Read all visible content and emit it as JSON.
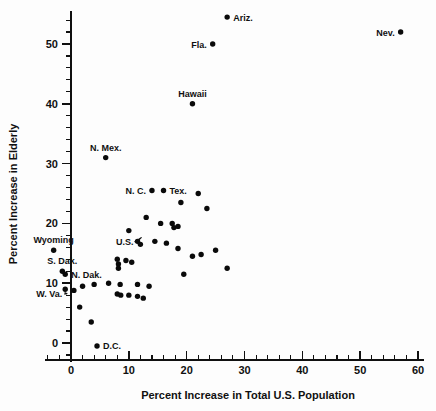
{
  "chart_data": {
    "type": "scatter",
    "title": "",
    "xlabel": "Percent Increase in Total U.S. Population",
    "ylabel": "Percent Increase in Elderly",
    "xlim": [
      -5,
      61
    ],
    "ylim": [
      -4,
      56
    ],
    "x_ticks": [
      0,
      10,
      20,
      30,
      40,
      50,
      60
    ],
    "x_tick_labels": [
      "0",
      "10",
      "20",
      "30",
      "40",
      "50",
      "60"
    ],
    "x_minor_step": 2,
    "y_ticks": [
      0,
      10,
      20,
      30,
      40,
      50
    ],
    "y_tick_labels": [
      "0",
      "10",
      "20",
      "30",
      "40",
      "50"
    ],
    "y_minor_step": 2,
    "grid": false,
    "legend": false,
    "marker": "filled-circle",
    "marker_color": "#0a0a0a",
    "points": [
      {
        "label": "Ariz.",
        "x": 27.0,
        "y": 54.5,
        "label_pos": "right"
      },
      {
        "label": "Nev.",
        "x": 57.0,
        "y": 52.0,
        "label_pos": "left"
      },
      {
        "label": "Fla.",
        "x": 24.5,
        "y": 50.0,
        "label_pos": "left"
      },
      {
        "label": "Hawaii",
        "x": 21.0,
        "y": 40.0,
        "label_pos": "above"
      },
      {
        "label": "N. Mex.",
        "x": 6.0,
        "y": 31.0,
        "label_pos": "above"
      },
      {
        "label": "N. C.",
        "x": 14.0,
        "y": 25.5,
        "label_pos": "left"
      },
      {
        "label": "Tex.",
        "x": 16.0,
        "y": 25.5,
        "label_pos": "right"
      },
      {
        "label": "Wyoming",
        "x": -3.0,
        "y": 15.5,
        "label_pos": "above"
      },
      {
        "label": "S. Dak.",
        "x": -1.5,
        "y": 12.0,
        "label_pos": "above"
      },
      {
        "label": "N. Dak.",
        "x": -1.0,
        "y": 11.5,
        "label_pos": "right"
      },
      {
        "label": "W. Va.",
        "x": -1.0,
        "y": 9.0,
        "label_pos": "leader"
      },
      {
        "label": "D.C.",
        "x": 4.5,
        "y": -0.5,
        "label_pos": "right"
      },
      {
        "label": "U.S.",
        "x": 11.5,
        "y": 17.0,
        "label_pos": "leader-right"
      },
      {
        "label": "",
        "x": 19.0,
        "y": 23.5
      },
      {
        "label": "",
        "x": 22.0,
        "y": 25.0
      },
      {
        "label": "",
        "x": 23.5,
        "y": 22.5
      },
      {
        "label": "",
        "x": 13.0,
        "y": 21.0
      },
      {
        "label": "",
        "x": 15.5,
        "y": 20.0
      },
      {
        "label": "",
        "x": 17.5,
        "y": 20.0
      },
      {
        "label": "",
        "x": 17.8,
        "y": 19.3
      },
      {
        "label": "",
        "x": 18.5,
        "y": 19.5
      },
      {
        "label": "",
        "x": 10.0,
        "y": 18.8
      },
      {
        "label": "",
        "x": 14.5,
        "y": 17.0
      },
      {
        "label": "",
        "x": 16.5,
        "y": 16.7
      },
      {
        "label": "",
        "x": 12.0,
        "y": 16.5
      },
      {
        "label": "",
        "x": 18.5,
        "y": 15.8
      },
      {
        "label": "",
        "x": 21.0,
        "y": 14.5
      },
      {
        "label": "",
        "x": 22.5,
        "y": 14.8
      },
      {
        "label": "",
        "x": 25.0,
        "y": 15.5
      },
      {
        "label": "",
        "x": 8.0,
        "y": 14.0
      },
      {
        "label": "",
        "x": 9.5,
        "y": 13.8
      },
      {
        "label": "",
        "x": 10.5,
        "y": 13.5
      },
      {
        "label": "",
        "x": 8.2,
        "y": 13.2
      },
      {
        "label": "",
        "x": 8.2,
        "y": 12.5
      },
      {
        "label": "",
        "x": 19.5,
        "y": 11.5
      },
      {
        "label": "",
        "x": 27.0,
        "y": 12.5
      },
      {
        "label": "",
        "x": 2.0,
        "y": 9.5
      },
      {
        "label": "",
        "x": 4.0,
        "y": 9.8
      },
      {
        "label": "",
        "x": 6.5,
        "y": 10.0
      },
      {
        "label": "",
        "x": 8.5,
        "y": 9.8
      },
      {
        "label": "",
        "x": 11.5,
        "y": 9.8
      },
      {
        "label": "",
        "x": 13.5,
        "y": 9.5
      },
      {
        "label": "",
        "x": 0.5,
        "y": 8.8
      },
      {
        "label": "",
        "x": 8.0,
        "y": 8.2
      },
      {
        "label": "",
        "x": 8.6,
        "y": 8.0
      },
      {
        "label": "",
        "x": 10.0,
        "y": 8.0
      },
      {
        "label": "",
        "x": 11.5,
        "y": 7.8
      },
      {
        "label": "",
        "x": 12.5,
        "y": 7.5
      },
      {
        "label": "",
        "x": 1.5,
        "y": 6.0
      },
      {
        "label": "",
        "x": 3.5,
        "y": 3.5
      }
    ]
  },
  "axes": {
    "x_title": "Percent Increase in Total U.S. Population",
    "y_title": "Percent Increase in Elderly"
  }
}
